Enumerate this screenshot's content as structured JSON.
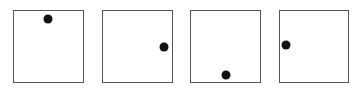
{
  "figure": {
    "colors": {
      "border": "#555555",
      "dot": "#111111",
      "background": "#ffffff"
    },
    "panels": [
      {
        "index": 1,
        "box": {
          "x": 13,
          "y": 10,
          "w": 71,
          "h": 73
        },
        "dot_position": "top",
        "dot": {
          "x": 48,
          "y": 19
        }
      },
      {
        "index": 2,
        "box": {
          "x": 102,
          "y": 10,
          "w": 71,
          "h": 73
        },
        "dot_position": "right",
        "dot": {
          "x": 164,
          "y": 47
        }
      },
      {
        "index": 3,
        "box": {
          "x": 190,
          "y": 10,
          "w": 71,
          "h": 73
        },
        "dot_position": "bottom",
        "dot": {
          "x": 226,
          "y": 75
        }
      },
      {
        "index": 4,
        "box": {
          "x": 279,
          "y": 10,
          "w": 70,
          "h": 73
        },
        "dot_position": "left",
        "dot": {
          "x": 286,
          "y": 45
        }
      }
    ]
  }
}
